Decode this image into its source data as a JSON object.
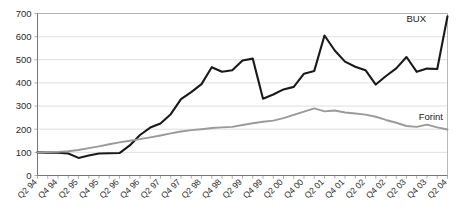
{
  "chart_data": {
    "type": "line",
    "title": "",
    "subtitle": "",
    "xlabel": "",
    "ylabel": "",
    "ylim": [
      0,
      700
    ],
    "ytick_values": [
      0,
      100,
      200,
      300,
      400,
      500,
      600,
      700
    ],
    "ytick_labels": [
      "0",
      "100",
      "200",
      "300",
      "400",
      "500",
      "600",
      "700"
    ],
    "grid": true,
    "grid_axis": "y",
    "legend_position": "inline-right",
    "x": [
      "Q2 94",
      "Q3 94",
      "Q4 94",
      "Q1 95",
      "Q2 95",
      "Q3 95",
      "Q4 95",
      "Q1 96",
      "Q2 96",
      "Q3 96",
      "Q4 96",
      "Q1 97",
      "Q2 97",
      "Q3 97",
      "Q4 97",
      "Q1 98",
      "Q2 98",
      "Q3 98",
      "Q4 98",
      "Q1 99",
      "Q2 99",
      "Q3 99",
      "Q4 99",
      "Q1 00",
      "Q2 00",
      "Q3 00",
      "Q4 00",
      "Q1 01",
      "Q2 01",
      "Q3 01",
      "Q4 01",
      "Q1 02",
      "Q2 02",
      "Q3 02",
      "Q4 02",
      "Q1 03",
      "Q2 03",
      "Q3 03",
      "Q4 03",
      "Q1 04",
      "Q2 04"
    ],
    "xtick_labels": [
      "Q2 94",
      "Q4 94",
      "Q2 95",
      "Q4 95",
      "Q2 96",
      "Q4 96",
      "Q2 97",
      "Q4 97",
      "Q2 98",
      "Q4 98",
      "Q2 99",
      "Q4 99",
      "Q2 00",
      "Q4 00",
      "Q2 01",
      "Q4 01",
      "Q2 02",
      "Q4 02",
      "Q2 03",
      "Q4 03",
      "Q2 04"
    ],
    "xtick_indices": [
      0,
      2,
      4,
      6,
      8,
      10,
      12,
      14,
      16,
      18,
      20,
      22,
      24,
      26,
      28,
      30,
      32,
      34,
      36,
      38,
      40
    ],
    "series": [
      {
        "name": "BUX",
        "color": "#1a1a1a",
        "width": 2.1,
        "label": "BUX",
        "values": [
          100,
          99,
          98,
          95,
          76,
          86,
          95,
          96,
          97,
          130,
          175,
          207,
          225,
          265,
          330,
          360,
          395,
          468,
          448,
          455,
          497,
          505,
          332,
          350,
          372,
          383,
          440,
          452,
          605,
          540,
          492,
          470,
          455,
          393,
          430,
          463,
          512,
          448,
          462,
          460,
          688
        ]
      },
      {
        "name": "Forint",
        "color": "#9a9a9a",
        "width": 1.9,
        "label": "Forint",
        "values": [
          100,
          101,
          102,
          105,
          110,
          118,
          126,
          135,
          143,
          150,
          157,
          165,
          173,
          182,
          190,
          196,
          200,
          205,
          208,
          210,
          218,
          226,
          232,
          237,
          248,
          262,
          276,
          290,
          277,
          281,
          272,
          268,
          263,
          254,
          240,
          228,
          214,
          210,
          220,
          208,
          199
        ]
      }
    ]
  },
  "legend": {
    "bux_label": "BUX",
    "forint_label": "Forint"
  }
}
